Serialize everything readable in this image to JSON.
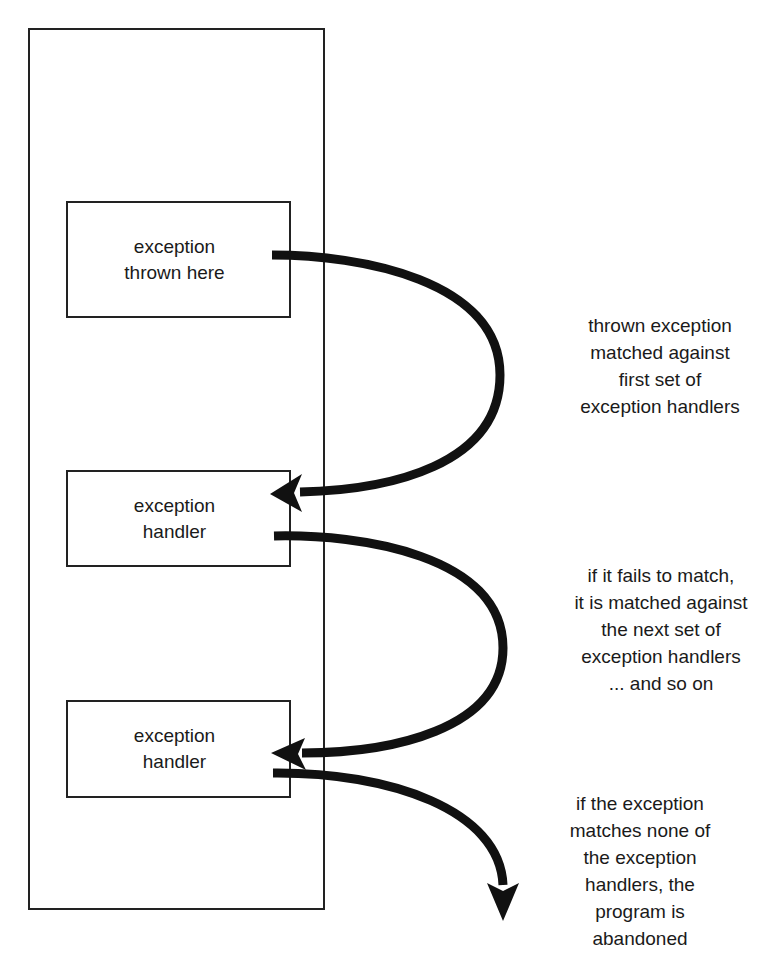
{
  "diagram": {
    "title": "",
    "container": {
      "label": ""
    },
    "boxes": [
      {
        "id": "thrown",
        "label": "exception\nthrown here"
      },
      {
        "id": "handler-1",
        "label": "exception\nhandler"
      },
      {
        "id": "handler-2",
        "label": "exception\nhandler"
      }
    ],
    "captions": [
      {
        "text": "thrown exception\nmatched against\nfirst set of\nexception handlers"
      },
      {
        "text": "if it fails to match,\nit is matched against\nthe next set of\nexception handlers\n... and so on"
      },
      {
        "text": "if the exception\nmatches none of\nthe exception\nhandlers, the\nprogram is\nabandoned"
      }
    ],
    "arrows": [
      {
        "from": "exception thrown here",
        "to": "exception handler (1)",
        "icon": "curved-arrow-icon"
      },
      {
        "from": "exception handler (1)",
        "to": "exception handler (2)",
        "icon": "curved-arrow-icon"
      },
      {
        "from": "exception handler (2)",
        "to": "outside (program abandoned)",
        "icon": "curved-arrow-down-icon"
      }
    ],
    "colors": {
      "stroke": "#111111",
      "background": "#ffffff"
    }
  }
}
